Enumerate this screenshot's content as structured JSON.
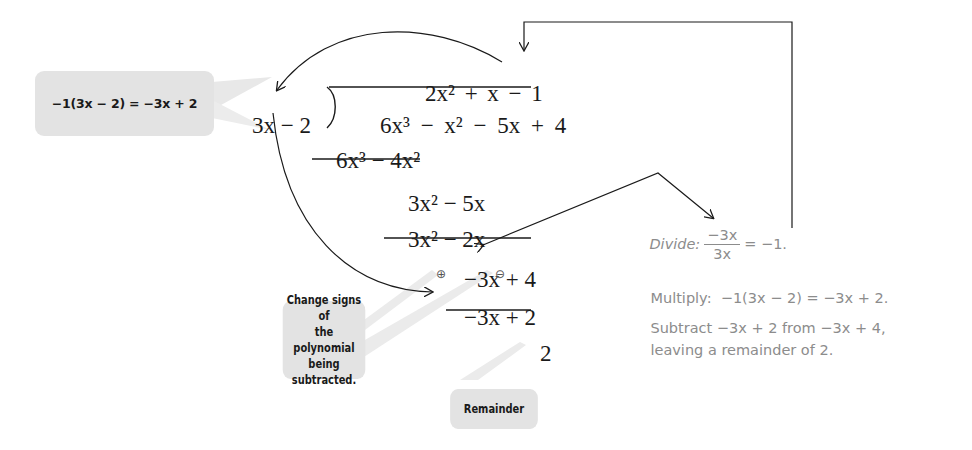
{
  "callouts": {
    "multiply_eq": "−1(3x − 2) = −3x + 2",
    "change_signs_lines": [
      "Change signs of",
      "the polynomial",
      "being subtracted."
    ],
    "remainder": "Remainder"
  },
  "long_division": {
    "divisor": "3x − 2",
    "quotient": "2x² + x − 1",
    "dividend": "6x³ − x² − 5x + 4",
    "rows": [
      "6x³ − 4x²",
      "3x² − 5x",
      "3x² − 2x",
      "−3x + 4",
      "−3x + 2",
      "2"
    ],
    "sign_marks": [
      "⊕",
      "⊖"
    ]
  },
  "steps": {
    "divide_label": "Divide:",
    "divide_numerator": "−3x",
    "divide_denominator": "3x",
    "divide_result": "= −1.",
    "multiply": "Multiply:  −1(3x − 2) = −3x + 2.",
    "subtract_line1": "Subtract −3x + 2 from −3x + 4,",
    "subtract_line2": "leaving a remainder of 2."
  },
  "colors": {
    "callout_bg": "#e3e3e3",
    "step_text": "#8c8c8c",
    "ink": "#1a1a1a"
  }
}
